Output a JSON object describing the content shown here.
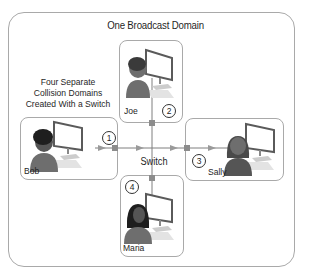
{
  "diagram": {
    "broadcast_domain_label": "One Broadcast Domain",
    "collision_caption_lines": [
      "Four Separate",
      "Collision Domains",
      "Created With a Switch"
    ],
    "switch_label": "Switch",
    "hosts": [
      {
        "name": "Joe",
        "port": "2",
        "gender": "male"
      },
      {
        "name": "Bob",
        "port": "1",
        "gender": "male"
      },
      {
        "name": "Sally",
        "port": "3",
        "gender": "female"
      },
      {
        "name": "Maria",
        "port": "4",
        "gender": "female"
      }
    ],
    "colors": {
      "border": "#a9a9a9",
      "link": "#7f7f7f",
      "arrow": "#9a9a9a",
      "port": "#8c8c8c",
      "person_body": "#6e6e6e",
      "person_hair": "#1e1e1e",
      "monitor_frame": "#5a5a5a"
    }
  }
}
